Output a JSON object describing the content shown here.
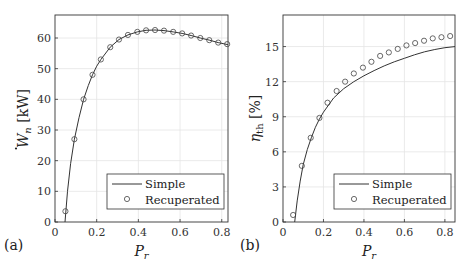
{
  "chart_data": [
    {
      "panel": "(a)",
      "type": "line",
      "xlabel": "P_r",
      "ylabel": "Ẇ_n [kW]",
      "xlim": [
        0,
        0.83
      ],
      "ylim": [
        0,
        67.5
      ],
      "xticks": [
        0,
        0.2,
        0.4,
        0.6,
        0.8
      ],
      "xtick_labels": [
        "0",
        "0.2",
        "0.4",
        "0.6",
        "0.8"
      ],
      "yticks": [
        0,
        10,
        20,
        30,
        40,
        50,
        60
      ],
      "ytick_labels": [
        "0",
        "10",
        "20",
        "30",
        "40",
        "50",
        "60"
      ],
      "grid": true,
      "legend_position": "lower right",
      "series": [
        {
          "name": "Simple",
          "style": "line",
          "x": [
            0.048,
            0.06,
            0.075,
            0.093,
            0.115,
            0.137,
            0.16,
            0.18,
            0.2,
            0.22,
            0.265,
            0.307,
            0.35,
            0.395,
            0.437,
            0.48,
            0.523,
            0.567,
            0.61,
            0.653,
            0.697,
            0.74,
            0.783,
            0.83
          ],
          "y": [
            0,
            10,
            19,
            27,
            34,
            40,
            44.5,
            48,
            50.8,
            53,
            57,
            59.5,
            61,
            62,
            62.5,
            62.6,
            62.4,
            62,
            61.5,
            60.8,
            60,
            59.3,
            58.5,
            57.8
          ]
        },
        {
          "name": "Recuperated",
          "style": "marker-circle",
          "x": [
            0.05,
            0.093,
            0.137,
            0.18,
            0.22,
            0.265,
            0.307,
            0.35,
            0.395,
            0.437,
            0.48,
            0.523,
            0.567,
            0.61,
            0.653,
            0.697,
            0.74,
            0.783,
            0.826
          ],
          "y": [
            3.5,
            27,
            40,
            48,
            53,
            57,
            59.5,
            61,
            62,
            62.5,
            62.6,
            62.4,
            62,
            61.5,
            60.8,
            60,
            59.3,
            58.5,
            58
          ]
        }
      ]
    },
    {
      "panel": "(b)",
      "type": "line",
      "xlabel": "P_r",
      "ylabel": "η_th [%]",
      "xlim": [
        0,
        0.85
      ],
      "ylim": [
        0,
        17.7
      ],
      "xticks": [
        0,
        0.2,
        0.4,
        0.6,
        0.8
      ],
      "xtick_labels": [
        "0",
        "0.2",
        "0.4",
        "0.6",
        "0.8"
      ],
      "yticks": [
        0,
        3,
        6,
        9,
        12,
        15
      ],
      "ytick_labels": [
        "0",
        "3",
        "6",
        "9",
        "12",
        "15"
      ],
      "grid": true,
      "legend_position": "lower right",
      "series": [
        {
          "name": "Simple",
          "style": "line",
          "x": [
            0.058,
            0.07,
            0.085,
            0.1,
            0.12,
            0.14,
            0.16,
            0.18,
            0.2,
            0.25,
            0.3,
            0.35,
            0.4,
            0.45,
            0.5,
            0.55,
            0.6,
            0.65,
            0.7,
            0.75,
            0.8,
            0.85
          ],
          "y": [
            0,
            1.8,
            3.5,
            4.9,
            6.2,
            7.2,
            8.1,
            8.8,
            9.4,
            10.6,
            11.4,
            12.0,
            12.5,
            12.95,
            13.35,
            13.7,
            14.0,
            14.3,
            14.55,
            14.75,
            14.9,
            15.0
          ]
        },
        {
          "name": "Recuperated",
          "style": "marker-circle",
          "x": [
            0.05,
            0.093,
            0.137,
            0.18,
            0.22,
            0.265,
            0.307,
            0.35,
            0.395,
            0.437,
            0.48,
            0.523,
            0.567,
            0.61,
            0.653,
            0.697,
            0.74,
            0.783,
            0.826
          ],
          "y": [
            0.6,
            4.8,
            7.2,
            8.9,
            10.2,
            11.2,
            12.0,
            12.7,
            13.2,
            13.7,
            14.2,
            14.5,
            14.8,
            15.1,
            15.3,
            15.5,
            15.7,
            15.8,
            15.9
          ]
        }
      ]
    }
  ],
  "legend": {
    "simple": "Simple",
    "recuperated": "Recuperated"
  },
  "panels": {
    "a": {
      "tag": "(a)",
      "xlabel_main": "P",
      "xlabel_sub": "r",
      "ylabel_main": "W",
      "ylabel_sub": "n",
      "ylabel_unit": "[kW]"
    },
    "b": {
      "tag": "(b)",
      "xlabel_main": "P",
      "xlabel_sub": "r",
      "ylabel_main": "η",
      "ylabel_sub": "th",
      "ylabel_unit": "[%]"
    }
  }
}
